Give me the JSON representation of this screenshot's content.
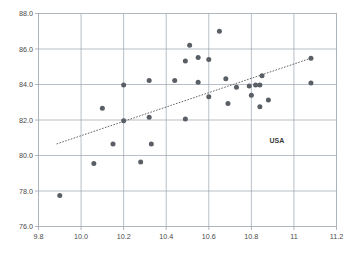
{
  "chart_data": {
    "type": "scatter",
    "title": "",
    "xlabel": "",
    "ylabel": "",
    "xlim": [
      9.8,
      11.2
    ],
    "ylim": [
      76.0,
      88.0
    ],
    "grid": true,
    "legend": null,
    "xticks": [
      "9.8",
      "10.0",
      "10.2",
      "10.4",
      "10.6",
      "10.8",
      "11",
      "11.2"
    ],
    "xtick_values": [
      9.8,
      10.0,
      10.2,
      10.4,
      10.6,
      10.8,
      11.0,
      11.2
    ],
    "yticks": [
      "76.0",
      "78.0",
      "80.0",
      "82.0",
      "84.0",
      "86.0",
      "88.0"
    ],
    "ytick_values": [
      76.0,
      78.0,
      80.0,
      82.0,
      84.0,
      86.0,
      88.0
    ],
    "marker_color": "#5a5f66",
    "grid_color": "#9aa3ad",
    "points": [
      {
        "x": 9.9,
        "y": 77.75
      },
      {
        "x": 10.06,
        "y": 79.55
      },
      {
        "x": 10.1,
        "y": 82.66
      },
      {
        "x": 10.15,
        "y": 80.65
      },
      {
        "x": 10.2,
        "y": 83.97
      },
      {
        "x": 10.2,
        "y": 81.96
      },
      {
        "x": 10.28,
        "y": 79.63
      },
      {
        "x": 10.32,
        "y": 84.22
      },
      {
        "x": 10.32,
        "y": 82.16
      },
      {
        "x": 10.33,
        "y": 80.65
      },
      {
        "x": 10.44,
        "y": 84.22
      },
      {
        "x": 10.49,
        "y": 85.33
      },
      {
        "x": 10.49,
        "y": 82.05
      },
      {
        "x": 10.51,
        "y": 86.21
      },
      {
        "x": 10.55,
        "y": 85.52
      },
      {
        "x": 10.55,
        "y": 84.12
      },
      {
        "x": 10.6,
        "y": 85.41
      },
      {
        "x": 10.6,
        "y": 83.31
      },
      {
        "x": 10.65,
        "y": 87.0
      },
      {
        "x": 10.68,
        "y": 84.32
      },
      {
        "x": 10.69,
        "y": 82.93
      },
      {
        "x": 10.73,
        "y": 83.84
      },
      {
        "x": 10.79,
        "y": 83.92
      },
      {
        "x": 10.82,
        "y": 83.97
      },
      {
        "x": 10.84,
        "y": 83.97
      },
      {
        "x": 10.8,
        "y": 83.4
      },
      {
        "x": 10.84,
        "y": 82.74
      },
      {
        "x": 10.85,
        "y": 84.5
      },
      {
        "x": 10.88,
        "y": 83.12
      },
      {
        "x": 11.08,
        "y": 85.48
      },
      {
        "x": 11.08,
        "y": 84.08
      }
    ],
    "trend_line": {
      "style": "dotted",
      "x_start": 9.885,
      "y_start": 80.65,
      "x_end": 11.08,
      "y_end": 85.48
    },
    "annotations": [
      {
        "label": "USA",
        "x": 10.92,
        "y": 80.7
      }
    ]
  }
}
